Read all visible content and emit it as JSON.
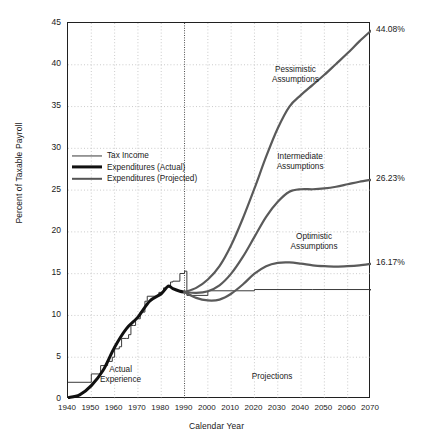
{
  "chart_data": {
    "type": "line",
    "title": "",
    "xlabel": "Calendar Year",
    "ylabel": "Percent of Taxable Payroll",
    "xlim": [
      1940,
      2070
    ],
    "ylim": [
      0,
      45
    ],
    "xticks": [
      1940,
      1950,
      1960,
      1970,
      1980,
      1990,
      2000,
      2010,
      2020,
      2030,
      2040,
      2050,
      2060,
      2070
    ],
    "yticks": [
      0,
      5,
      10,
      15,
      20,
      25,
      30,
      35,
      40,
      45
    ],
    "grid": true,
    "legend_position": "upper-left-inside",
    "divider_year": 1990,
    "series": [
      {
        "name": "Tax Income",
        "style": "thin-step",
        "x": [
          1940,
          1949,
          1950,
          1953,
          1954,
          1956,
          1957,
          1958,
          1959,
          1960,
          1962,
          1963,
          1965,
          1966,
          1967,
          1968,
          1969,
          1971,
          1973,
          1974,
          1978,
          1979,
          1981,
          1982,
          1984,
          1985,
          1988,
          1990,
          1991,
          2000,
          2020,
          2045,
          2070
        ],
        "y": [
          2.0,
          2.0,
          3.0,
          3.0,
          4.0,
          4.0,
          4.5,
          4.5,
          5.0,
          6.0,
          6.25,
          7.25,
          7.25,
          7.7,
          8.8,
          8.8,
          9.6,
          10.4,
          11.7,
          12.3,
          12.3,
          12.76,
          13.3,
          13.4,
          14.0,
          14.1,
          15.02,
          15.3,
          12.4,
          12.95,
          13.1,
          13.1,
          13.0
        ]
      },
      {
        "name": "Expenditures (Actual)",
        "style": "thick-black",
        "x": [
          1940,
          1945,
          1950,
          1955,
          1960,
          1965,
          1970,
          1975,
          1980,
          1983,
          1985,
          1988,
          1990
        ],
        "y": [
          0.15,
          0.5,
          1.6,
          3.4,
          6.2,
          8.4,
          9.8,
          11.7,
          12.6,
          13.5,
          13.2,
          12.9,
          12.8
        ]
      },
      {
        "name": "Expenditures (Projected) - Pessimistic",
        "style": "medium-gray",
        "label": "Pessimistic Assumptions",
        "end_value": 44.08,
        "x": [
          1990,
          1995,
          2000,
          2005,
          2010,
          2015,
          2020,
          2025,
          2030,
          2035,
          2040,
          2045,
          2050,
          2055,
          2060,
          2065,
          2070
        ],
        "y": [
          12.8,
          13.3,
          14.3,
          15.9,
          18.4,
          21.6,
          25.2,
          29.0,
          32.4,
          35.0,
          36.4,
          37.6,
          38.8,
          40.1,
          41.4,
          42.8,
          44.08
        ]
      },
      {
        "name": "Expenditures (Projected) - Intermediate",
        "style": "medium-gray",
        "label": "Intermediate Assumptions",
        "end_value": 26.23,
        "x": [
          1990,
          1995,
          2000,
          2005,
          2010,
          2015,
          2020,
          2025,
          2030,
          2035,
          2040,
          2045,
          2050,
          2055,
          2060,
          2065,
          2070
        ],
        "y": [
          12.8,
          12.7,
          12.9,
          13.6,
          15.0,
          17.0,
          19.4,
          21.8,
          23.6,
          24.8,
          25.1,
          25.1,
          25.2,
          25.4,
          25.7,
          26.0,
          26.23
        ]
      },
      {
        "name": "Expenditures (Projected) - Optimistic",
        "style": "medium-gray",
        "label": "Optimistic Assumptions",
        "end_value": 16.17,
        "x": [
          1990,
          1995,
          2000,
          2005,
          2010,
          2015,
          2020,
          2025,
          2030,
          2035,
          2040,
          2045,
          2050,
          2055,
          2060,
          2065,
          2070
        ],
        "y": [
          12.8,
          12.1,
          11.8,
          11.9,
          12.6,
          13.7,
          15.0,
          15.9,
          16.3,
          16.35,
          16.2,
          16.0,
          15.9,
          15.85,
          15.9,
          16.0,
          16.17
        ]
      }
    ],
    "annotations": [
      {
        "text": "Actual Experience",
        "x": 1963,
        "y": 2.8
      },
      {
        "text": "Projections",
        "x": 2028,
        "y": 2.8
      }
    ],
    "end_labels": [
      {
        "text": "44.08%",
        "value": 44.08
      },
      {
        "text": "26.23%",
        "value": 26.23
      },
      {
        "text": "16.17%",
        "value": 16.17
      }
    ]
  },
  "legend": {
    "items": [
      {
        "label": "Tax Income"
      },
      {
        "label": "Expenditures (Actual)"
      },
      {
        "label": "Expenditures (Projected)"
      }
    ]
  },
  "labels": {
    "pessimistic_line1": "Pessimistic",
    "pessimistic_line2": "Assumptions",
    "intermediate_line1": "Intermediate",
    "intermediate_line2": "Assumptions",
    "optimistic_line1": "Optimistic",
    "optimistic_line2": "Assumptions",
    "actual_line1": "Actual",
    "actual_line2": "Experience",
    "projections": "Projections"
  }
}
